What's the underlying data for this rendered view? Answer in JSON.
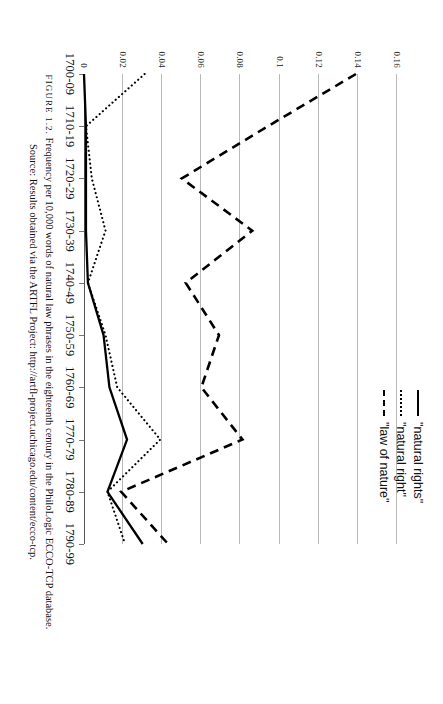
{
  "legend": {
    "position": "top-right",
    "items": [
      {
        "label": "\"natural rights\"",
        "style": "solid",
        "key": "solid-line-key"
      },
      {
        "label": "\"natural right\"",
        "style": "dotted",
        "key": "dotted-line-key"
      },
      {
        "label": "\"law of nature\"",
        "style": "dashed",
        "key": "dashed-line-key"
      }
    ]
  },
  "caption": {
    "figure_number": "FIGURE 1.2.",
    "line1": "Frequency per 10,000 words of natural law phrases in the eighteenth century in the PhiloLogic ECCO-TCP database.",
    "line2": "Source: Results obtained via the ARTFL Project: http://artfl-project.uchicago.edu/content/ecco-tcp."
  },
  "chart_data": {
    "type": "line",
    "title": "",
    "xlabel": "",
    "ylabel": "",
    "ylim": [
      0,
      0.16
    ],
    "yticks": [
      0,
      0.02,
      0.04,
      0.06,
      0.08,
      0.1,
      0.12,
      0.14,
      0.16
    ],
    "ytick_labels": [
      "0",
      "0.02",
      "0.04",
      "0.06",
      "0.08",
      "0.1",
      "0.12",
      "0.14",
      "0.16"
    ],
    "grid": true,
    "categories": [
      "1700-09",
      "1710-19",
      "1720-29",
      "1730-39",
      "1740-49",
      "1750-59",
      "1760-69",
      "1770-79",
      "1780-89",
      "1790-99"
    ],
    "series": [
      {
        "name": "\"natural rights\"",
        "style": "solid",
        "values": [
          0.0,
          0.001,
          0.001,
          0.001,
          0.002,
          0.01,
          0.013,
          0.022,
          0.012,
          0.03
        ]
      },
      {
        "name": "\"natural right\"",
        "style": "dotted",
        "values": [
          0.031,
          0.001,
          0.004,
          0.011,
          0.002,
          0.011,
          0.017,
          0.039,
          0.012,
          0.021
        ]
      },
      {
        "name": "\"law of nature\"",
        "style": "dashed",
        "values": [
          0.139,
          0.094,
          0.05,
          0.086,
          0.052,
          0.069,
          0.06,
          0.081,
          0.019,
          0.043
        ]
      }
    ]
  }
}
